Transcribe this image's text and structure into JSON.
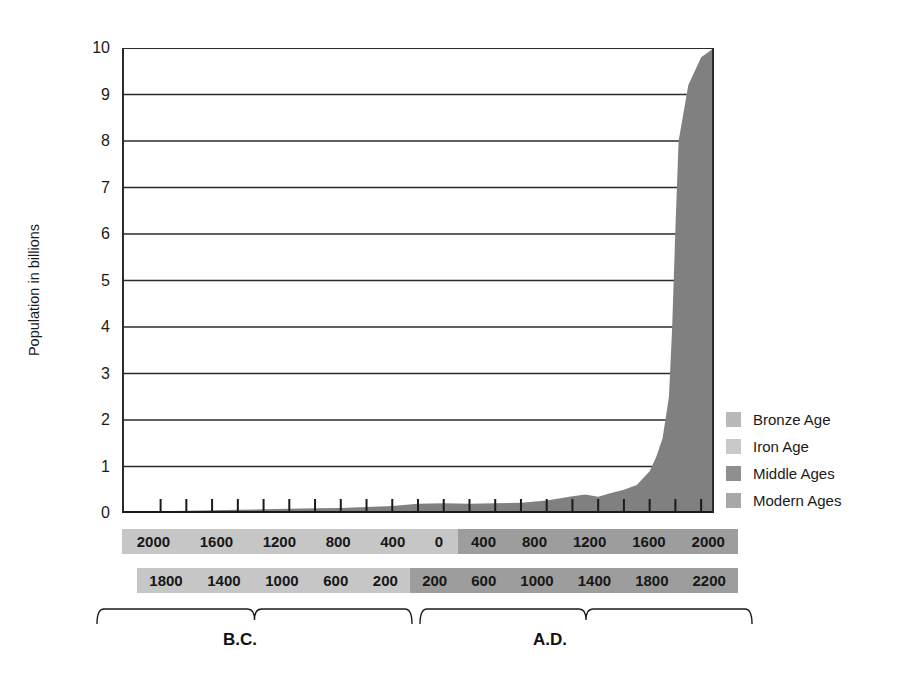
{
  "chart_data": {
    "type": "area",
    "title": "",
    "xlabel": "",
    "ylabel": "Population in billions",
    "ylim": [
      0,
      10
    ],
    "ytick_labels": [
      "10",
      "9",
      "8",
      "7",
      "6",
      "5",
      "4",
      "3",
      "2",
      "1",
      "0"
    ],
    "ytick_values": [
      10,
      9,
      8,
      7,
      6,
      5,
      4,
      3,
      2,
      1,
      0
    ],
    "grid": true,
    "grid_axis": "y",
    "xlim": [
      -2300,
      2300
    ],
    "x_note": "Negative years are B.C., positive years are A.D.",
    "legend_position": "right",
    "series": [
      {
        "name": "World population",
        "x": [
          -2300,
          -2000,
          -1800,
          -1600,
          -1400,
          -1200,
          -1000,
          -800,
          -600,
          -400,
          -200,
          0,
          200,
          400,
          600,
          800,
          1000,
          1200,
          1300,
          1400,
          1500,
          1600,
          1700,
          1800,
          1850,
          1900,
          1950,
          1975,
          2000,
          2025,
          2100,
          2200,
          2300
        ],
        "values": [
          0.03,
          0.04,
          0.05,
          0.06,
          0.07,
          0.08,
          0.09,
          0.1,
          0.11,
          0.13,
          0.15,
          0.2,
          0.21,
          0.2,
          0.21,
          0.22,
          0.27,
          0.36,
          0.4,
          0.35,
          0.43,
          0.5,
          0.6,
          0.9,
          1.2,
          1.6,
          2.5,
          4.0,
          6.1,
          8.0,
          9.2,
          9.8,
          10.0
        ]
      }
    ],
    "area_color": "#808080",
    "axis_color": "#1a1a1a",
    "grid_color": "#2b2b2b",
    "legend": [
      {
        "label": "Bronze Age",
        "color": "#b9b9b9"
      },
      {
        "label": "Iron Age",
        "color": "#c9c9c9"
      },
      {
        "label": "Middle Ages",
        "color": "#8f8f8f"
      },
      {
        "label": "Modern Ages",
        "color": "#a8a8a8"
      }
    ],
    "x_bands": [
      {
        "name": "band-millennia",
        "bc_labels": [
          "2000",
          "1600",
          "1200",
          "800",
          "400"
        ],
        "zero_label": "0",
        "ad_labels": [
          "400",
          "800",
          "1200",
          "1600",
          "2000"
        ],
        "bc_color": "#c6c6c6",
        "ad_color": "#9d9d9d"
      },
      {
        "name": "band-offset",
        "bc_labels": [
          "1800",
          "1400",
          "1000",
          "600",
          "200"
        ],
        "ad_labels": [
          "200",
          "600",
          "1000",
          "1400",
          "1800",
          "2200"
        ],
        "bc_color": "#c6c6c6",
        "ad_color": "#9d9d9d"
      }
    ],
    "era_labels": {
      "bc": "B.C.",
      "ad": "A.D."
    }
  }
}
